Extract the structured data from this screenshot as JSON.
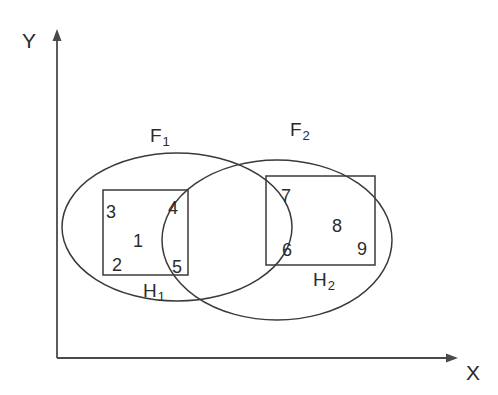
{
  "figure": {
    "background_color": "#ffffff",
    "stroke_color": "#3a3a3a",
    "text_color": "#2b2b2b"
  },
  "axes": {
    "y_label": "Y",
    "x_label": "X",
    "origin": {
      "x": 57,
      "y": 358
    },
    "y_axis_top": {
      "x": 57,
      "y": 30
    },
    "x_axis_right": {
      "x": 458,
      "y": 358
    }
  },
  "ellipses": [
    {
      "name": "F1",
      "label": "F",
      "subscript": "1",
      "cx": 177,
      "cy": 227,
      "rx": 115,
      "ry": 74,
      "label_pos": {
        "x": 150,
        "y": 126
      }
    },
    {
      "name": "F2",
      "label": "F",
      "subscript": "2",
      "cx": 277,
      "cy": 240,
      "rx": 115,
      "ry": 80,
      "label_pos": {
        "x": 290,
        "y": 120
      }
    }
  ],
  "rectangles": [
    {
      "name": "H1",
      "label": "H",
      "subscript": "1",
      "x": 103,
      "y": 190,
      "width": 85,
      "height": 85,
      "label_pos": {
        "x": 143,
        "y": 281
      }
    },
    {
      "name": "H2",
      "label": "H",
      "subscript": "2",
      "x": 266,
      "y": 176,
      "width": 109,
      "height": 89,
      "label_pos": {
        "x": 313,
        "y": 270
      }
    }
  ],
  "region_numbers": [
    {
      "id": "region-3",
      "value": "3",
      "x": 106,
      "y": 203
    },
    {
      "id": "region-4",
      "value": "4",
      "x": 168,
      "y": 199
    },
    {
      "id": "region-1",
      "value": "1",
      "x": 133,
      "y": 232
    },
    {
      "id": "region-2",
      "value": "2",
      "x": 112,
      "y": 256
    },
    {
      "id": "region-5",
      "value": "5",
      "x": 172,
      "y": 258
    },
    {
      "id": "region-7",
      "value": "7",
      "x": 281,
      "y": 187
    },
    {
      "id": "region-8",
      "value": "8",
      "x": 332,
      "y": 217
    },
    {
      "id": "region-6",
      "value": "6",
      "x": 282,
      "y": 241
    },
    {
      "id": "region-9",
      "value": "9",
      "x": 357,
      "y": 240
    }
  ]
}
